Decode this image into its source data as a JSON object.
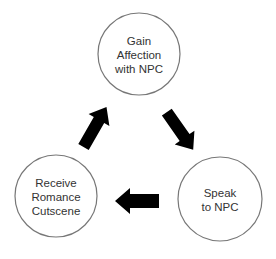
{
  "diagram": {
    "type": "cycle",
    "nodes": [
      {
        "id": "gain",
        "label": "Gain\nAffection\nwith NPC",
        "cx": 139,
        "cy": 54,
        "r": 41
      },
      {
        "id": "speak",
        "label": "Speak\nto NPC",
        "cx": 220,
        "cy": 199,
        "r": 42
      },
      {
        "id": "receive",
        "label": "Receive\nRomance\nCutscene",
        "cx": 56,
        "cy": 196,
        "r": 41
      }
    ],
    "edges": [
      {
        "from": "gain",
        "to": "speak"
      },
      {
        "from": "speak",
        "to": "receive"
      },
      {
        "from": "receive",
        "to": "gain"
      }
    ],
    "colors": {
      "circle_stroke": "#777777",
      "arrow_fill": "#000000",
      "text": "#333333",
      "background": "#ffffff"
    }
  }
}
